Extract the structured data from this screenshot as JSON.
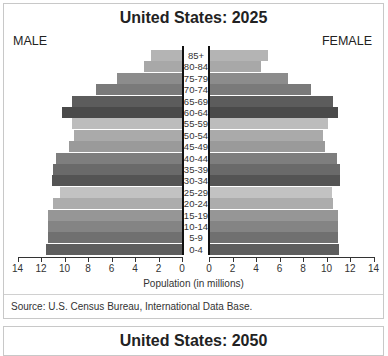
{
  "panels": [
    {
      "title": "United States: 2025",
      "male_label": "MALE",
      "female_label": "FEMALE",
      "xlabel": "Population (in millions)",
      "source": "Source: U.S. Census Bureau, International Data Base."
    },
    {
      "title": "United States: 2050"
    }
  ],
  "chart_data": {
    "type": "bar",
    "subtype": "population-pyramid",
    "title": "United States: 2025",
    "xlabel": "Population (in millions)",
    "ylabel": "",
    "left_label": "MALE",
    "right_label": "FEMALE",
    "xlim": [
      0,
      14
    ],
    "x_ticks_left": [
      14,
      12,
      10,
      8,
      6,
      4,
      2,
      0
    ],
    "x_ticks_right": [
      0,
      2,
      4,
      6,
      8,
      10,
      12,
      14
    ],
    "grid": false,
    "categories": [
      "85+",
      "80-84",
      "75-79",
      "70-74",
      "65-69",
      "60-64",
      "55-59",
      "50-54",
      "45-49",
      "40-44",
      "35-39",
      "30-34",
      "25-29",
      "20-24",
      "15-19",
      "10-14",
      "5-9",
      "0-4"
    ],
    "series": [
      {
        "name": "Male",
        "values": [
          2.6,
          3.2,
          5.5,
          7.3,
          9.4,
          10.2,
          9.4,
          9.2,
          9.6,
          10.7,
          11.0,
          11.1,
          10.4,
          11.0,
          11.4,
          11.4,
          11.4,
          11.6
        ]
      },
      {
        "name": "Female",
        "values": [
          4.9,
          4.3,
          6.6,
          8.6,
          10.5,
          10.9,
          10.0,
          9.6,
          9.8,
          10.8,
          11.1,
          11.1,
          10.4,
          10.5,
          10.9,
          10.9,
          10.9,
          11.0
        ]
      }
    ],
    "bar_colors": [
      "#b4b4b4",
      "#a8a8a8",
      "#8c8c8c",
      "#7a7a7a",
      "#5c5c5c",
      "#4a4a4a",
      "#bcbcbc",
      "#aaaaaa",
      "#9a9a9a",
      "#7e7e7e",
      "#6a6a6a",
      "#545454",
      "#c2c2c2",
      "#acacac",
      "#969696",
      "#848484",
      "#707070",
      "#5e5e5e"
    ],
    "source": "Source: U.S. Census Bureau, International Data Base.",
    "second_chart_title": "United States: 2050"
  }
}
